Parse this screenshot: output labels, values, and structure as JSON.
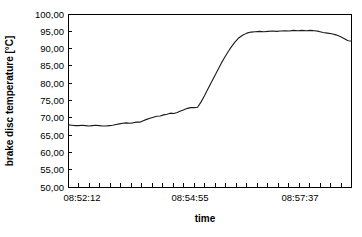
{
  "chart_data": {
    "type": "line",
    "title": "",
    "xlabel": "time",
    "ylabel": "brake disc temperature  [°C]",
    "ylim": [
      50,
      100
    ],
    "ytick_labels": [
      "100,00",
      "95,00",
      "90,00",
      "85,00",
      "80,00",
      "75,00",
      "70,00",
      "65,00",
      "60,00",
      "55,00",
      "50,00"
    ],
    "ytick_values": [
      100,
      95,
      90,
      85,
      80,
      75,
      70,
      65,
      60,
      55,
      50
    ],
    "xtick_labels": [
      "08:52:12",
      "08:54:55",
      "08:57:37"
    ],
    "xtick_positions": [
      0.05,
      0.43,
      0.82
    ],
    "x_minor_tick_count": 27,
    "grid": false,
    "legend": false,
    "line_color": "#1a1a1a",
    "background_color": "#ffffff",
    "series": [
      {
        "name": "brake disc temperature",
        "x": [
          0.0,
          0.012,
          0.024,
          0.036,
          0.048,
          0.06,
          0.072,
          0.084,
          0.096,
          0.108,
          0.12,
          0.132,
          0.144,
          0.156,
          0.168,
          0.18,
          0.192,
          0.204,
          0.216,
          0.228,
          0.24,
          0.252,
          0.264,
          0.276,
          0.288,
          0.3,
          0.312,
          0.324,
          0.336,
          0.348,
          0.36,
          0.372,
          0.384,
          0.396,
          0.408,
          0.42,
          0.432,
          0.444,
          0.456,
          0.468,
          0.48,
          0.492,
          0.504,
          0.516,
          0.528,
          0.54,
          0.552,
          0.564,
          0.576,
          0.588,
          0.6,
          0.615,
          0.63,
          0.645,
          0.66,
          0.675,
          0.69,
          0.705,
          0.72,
          0.735,
          0.75,
          0.765,
          0.78,
          0.795,
          0.81,
          0.825,
          0.84,
          0.855,
          0.87,
          0.885,
          0.9,
          0.915,
          0.93,
          0.945,
          0.96,
          0.975,
          0.988,
          1.0
        ],
        "y": [
          68.0,
          67.9,
          67.8,
          67.8,
          67.9,
          67.8,
          67.7,
          67.8,
          67.9,
          67.8,
          67.7,
          67.7,
          67.8,
          67.9,
          68.1,
          68.3,
          68.5,
          68.6,
          68.5,
          68.6,
          68.8,
          68.8,
          69.2,
          69.6,
          69.9,
          70.2,
          70.5,
          70.6,
          70.9,
          71.1,
          71.4,
          71.3,
          71.6,
          72.0,
          72.4,
          72.8,
          73.0,
          73.0,
          73.1,
          74.6,
          76.4,
          78.3,
          80.2,
          82.1,
          84.0,
          85.9,
          87.6,
          89.2,
          90.7,
          92.0,
          93.1,
          94.0,
          94.6,
          94.9,
          95.0,
          95.1,
          95.0,
          95.1,
          95.2,
          95.1,
          95.2,
          95.3,
          95.2,
          95.4,
          95.3,
          95.4,
          95.3,
          95.4,
          95.3,
          95.1,
          94.8,
          94.6,
          94.4,
          94.1,
          93.6,
          93.0,
          92.4,
          92.3
        ]
      }
    ]
  },
  "axes": {
    "y_title": "brake disc temperature  [°C]",
    "x_title": "time"
  }
}
